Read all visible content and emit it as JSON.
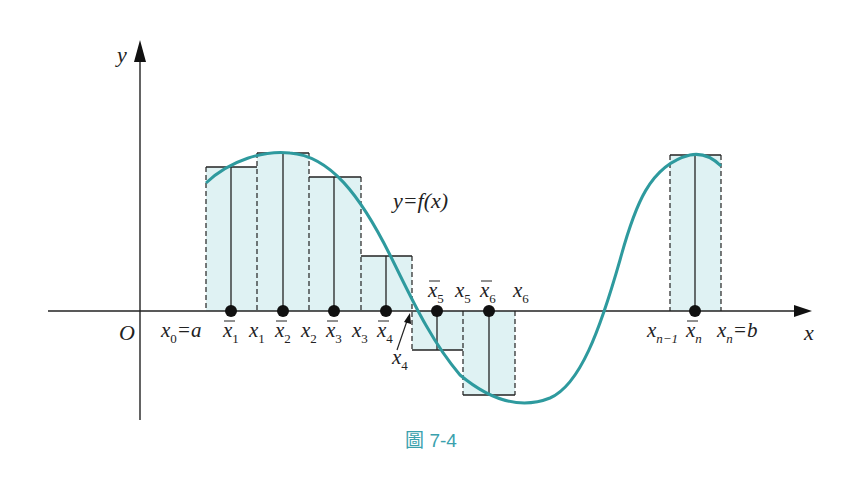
{
  "figure": {
    "caption": "圖 7-4",
    "caption_color": "#3aa1ad",
    "curve_color": "#2e9a9e",
    "fill_color": "#dff2f3",
    "curve_label": "y=f(x)",
    "axes": {
      "x_label": "x",
      "y_label": "y",
      "origin_label": "O"
    },
    "partition_labels": [
      {
        "text": "x",
        "sub": "0",
        "suffix": "=a"
      },
      {
        "text": "x",
        "sub": "1"
      },
      {
        "text": "x",
        "sub": "2"
      },
      {
        "text": "x",
        "sub": "3"
      },
      {
        "text": "x",
        "sub": "4"
      },
      {
        "text": "x",
        "sub": "5"
      },
      {
        "text": "x",
        "sub": "6"
      },
      {
        "text": "x",
        "sub": "n−1"
      },
      {
        "text": "x",
        "sub": "n",
        "suffix": "=b"
      }
    ],
    "sample_labels": [
      {
        "text": "x̄",
        "sub": "1"
      },
      {
        "text": "x̄",
        "sub": "2"
      },
      {
        "text": "x̄",
        "sub": "3"
      },
      {
        "text": "x̄",
        "sub": "4"
      },
      {
        "text": "x̄",
        "sub": "5"
      },
      {
        "text": "x̄",
        "sub": "6"
      },
      {
        "text": "x̄",
        "sub": "n"
      }
    ],
    "labels": {
      "x0": "x",
      "x0_sub": "0",
      "eq_a": "=a",
      "x1": "x",
      "x1_sub": "1",
      "x2": "x",
      "x2_sub": "2",
      "x3": "x",
      "x3_sub": "3",
      "x4": "x",
      "x4_sub": "4",
      "x5": "x",
      "x5_sub": "5",
      "x6": "x",
      "x6_sub": "6",
      "xn1": "x",
      "xn1_sub": "n−1",
      "xn": "x",
      "xn_sub": "n",
      "eq_b": "=b",
      "xb1_sub": "1",
      "xb2_sub": "2",
      "xb3_sub": "3",
      "xb4_sub": "4",
      "xb5_sub": "5",
      "xb6_sub": "6",
      "xbn_sub": "n",
      "xb": "x"
    }
  }
}
